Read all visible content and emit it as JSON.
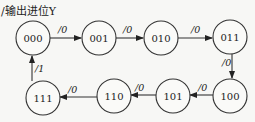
{
  "title": "/输出进位Y",
  "states": [
    {
      "id": "s000",
      "label": "000",
      "cx": 33,
      "cy": 38
    },
    {
      "id": "s001",
      "label": "001",
      "cx": 99,
      "cy": 38
    },
    {
      "id": "s010",
      "label": "010",
      "cx": 161,
      "cy": 38
    },
    {
      "id": "s011",
      "label": "011",
      "cx": 230,
      "cy": 37
    },
    {
      "id": "s100",
      "label": "100",
      "cx": 230,
      "cy": 96
    },
    {
      "id": "s101",
      "label": "101",
      "cx": 173,
      "cy": 96
    },
    {
      "id": "s110",
      "label": "110",
      "cx": 114,
      "cy": 96
    },
    {
      "id": "s111",
      "label": "111",
      "cx": 43,
      "cy": 98
    }
  ],
  "transitions": [
    {
      "from": "000",
      "to": "001",
      "label": "/0"
    },
    {
      "from": "001",
      "to": "010",
      "label": "/0"
    },
    {
      "from": "010",
      "to": "011",
      "label": "/0"
    },
    {
      "from": "011",
      "to": "100",
      "label": "/0"
    },
    {
      "from": "100",
      "to": "101",
      "label": "/0"
    },
    {
      "from": "101",
      "to": "110",
      "label": "/0"
    },
    {
      "from": "110",
      "to": "111",
      "label": "/0"
    },
    {
      "from": "111",
      "to": "000",
      "label": "/1"
    }
  ]
}
